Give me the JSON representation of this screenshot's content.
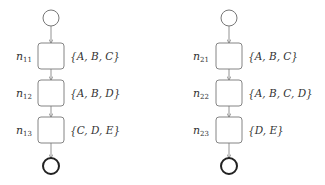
{
  "colors": {
    "stroke": "#777777",
    "end_stroke": "#222222",
    "text": "#333333",
    "background": "#ffffff"
  },
  "processes": [
    {
      "id": "left",
      "center_x": 51,
      "nodes": [
        {
          "name": "n",
          "sub": "11",
          "set": "{A, B, C}"
        },
        {
          "name": "n",
          "sub": "12",
          "set": "{A, B, D}"
        },
        {
          "name": "n",
          "sub": "13",
          "set": "{C, D, E}"
        }
      ]
    },
    {
      "id": "right",
      "center_x": 229,
      "nodes": [
        {
          "name": "n",
          "sub": "21",
          "set": "{A, B, C}"
        },
        {
          "name": "n",
          "sub": "22",
          "set": "{A, B, C, D}"
        },
        {
          "name": "n",
          "sub": "23",
          "set": "{D, E}"
        }
      ]
    }
  ]
}
